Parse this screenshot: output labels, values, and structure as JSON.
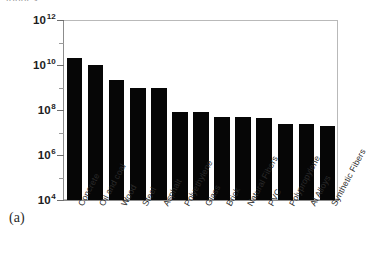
{
  "figure": {
    "panel_label": "(a)",
    "top_caption": "tonnes"
  },
  "chart_data": {
    "type": "bar",
    "title": "",
    "subtitle": "",
    "xlabel": "",
    "ylabel": "tonnes",
    "scale": "log",
    "grid": false,
    "legend": "none",
    "ylim": [
      10000,
      1000000000000
    ],
    "ytick_labels": [
      "10",
      "10",
      "10",
      "10",
      "10"
    ],
    "ytick_exponents": [
      "12",
      "10",
      "8",
      "6",
      "4"
    ],
    "ytick_values": [
      1000000000000,
      10000000000,
      100000000,
      1000000,
      10000
    ],
    "categories": [
      "Concrete",
      "Oil and coal",
      "Wood",
      "Steel",
      "Asphalt",
      "Polyethylene",
      "Glass",
      "Brick",
      "Natural Fibers",
      "PVC",
      "Polypropylene",
      "Al Alloys",
      "Synthetic Fibers"
    ],
    "values": [
      20000000000,
      10000000000,
      2200000000,
      1000000000,
      1000000000,
      80000000,
      82000000,
      48000000,
      48000000,
      42000000,
      24000000,
      24000000,
      19000000
    ],
    "bar_color": "#060606",
    "axis_color": "#8c8c8c",
    "background_color": "#ffffff"
  }
}
